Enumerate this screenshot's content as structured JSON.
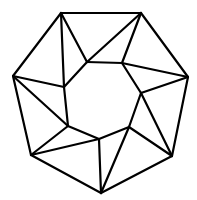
{
  "diagram": {
    "type": "geometric-figure",
    "stroke_color": "#000000",
    "background": "#ffffff",
    "outer_vertices": [
      {
        "id": "A",
        "x": 61,
        "y": 13
      },
      {
        "id": "B",
        "x": 141,
        "y": 13
      },
      {
        "id": "C",
        "x": 188,
        "y": 77
      },
      {
        "id": "D",
        "x": 172,
        "y": 156
      },
      {
        "id": "E",
        "x": 101,
        "y": 193
      },
      {
        "id": "F",
        "x": 31,
        "y": 155
      },
      {
        "id": "G",
        "x": 13,
        "y": 76
      }
    ],
    "inner_vertices": [
      {
        "id": "a",
        "x": 87,
        "y": 62
      },
      {
        "id": "b",
        "x": 122,
        "y": 63
      },
      {
        "id": "c",
        "x": 141,
        "y": 93
      },
      {
        "id": "d",
        "x": 129,
        "y": 127
      },
      {
        "id": "e",
        "x": 99,
        "y": 139
      },
      {
        "id": "f",
        "x": 68,
        "y": 126
      },
      {
        "id": "g",
        "x": 64,
        "y": 87
      }
    ],
    "edges": [
      [
        "A",
        "B"
      ],
      [
        "B",
        "C"
      ],
      [
        "C",
        "D"
      ],
      [
        "D",
        "E"
      ],
      [
        "E",
        "F"
      ],
      [
        "F",
        "G"
      ],
      [
        "G",
        "A"
      ],
      [
        "a",
        "b"
      ],
      [
        "b",
        "c"
      ],
      [
        "c",
        "d"
      ],
      [
        "d",
        "e"
      ],
      [
        "e",
        "f"
      ],
      [
        "f",
        "g"
      ],
      [
        "g",
        "a"
      ],
      [
        "A",
        "a"
      ],
      [
        "A",
        "g"
      ],
      [
        "B",
        "a"
      ],
      [
        "B",
        "b"
      ],
      [
        "C",
        "b"
      ],
      [
        "C",
        "c"
      ],
      [
        "D",
        "c"
      ],
      [
        "D",
        "d"
      ],
      [
        "E",
        "d"
      ],
      [
        "E",
        "e"
      ],
      [
        "F",
        "e"
      ],
      [
        "F",
        "f"
      ],
      [
        "G",
        "f"
      ],
      [
        "G",
        "g"
      ]
    ]
  }
}
